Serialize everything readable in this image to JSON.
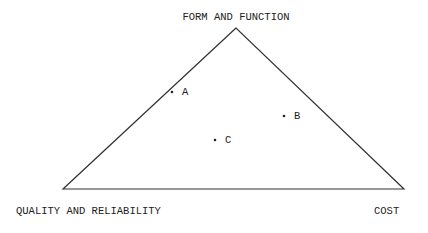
{
  "diagram": {
    "type": "ternary-triangle",
    "vertices": {
      "top": "FORM AND FUNCTION",
      "bottom_left": "QUALITY AND RELIABILITY",
      "bottom_right": "COST"
    },
    "points": [
      {
        "label": "A"
      },
      {
        "label": "B"
      },
      {
        "label": "C"
      }
    ],
    "line_color": "#333333"
  }
}
